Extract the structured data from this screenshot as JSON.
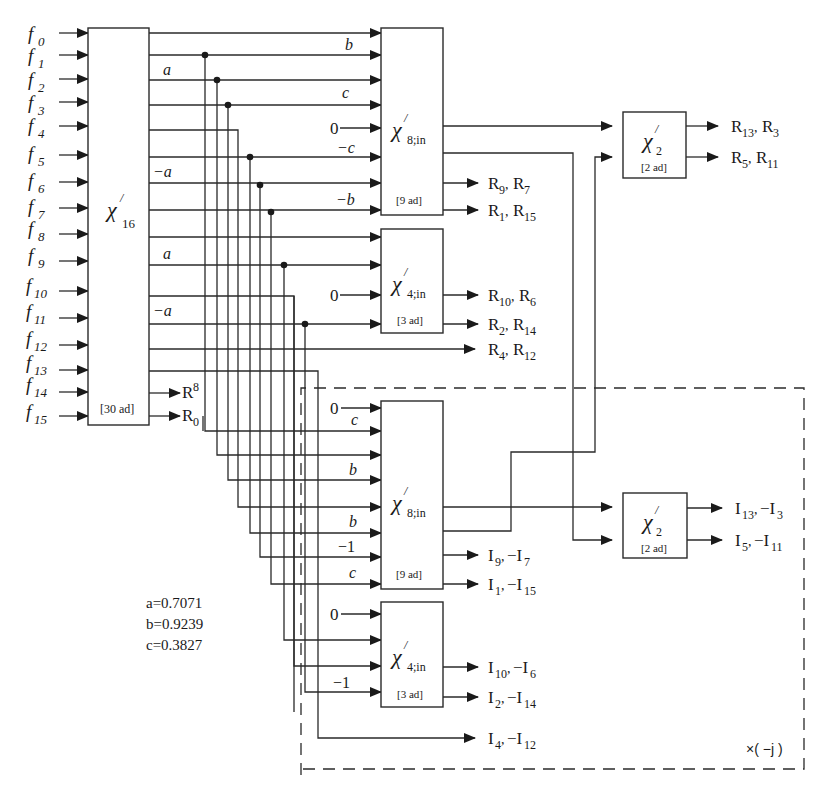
{
  "figure": {
    "type": "signal-flow block diagram",
    "inputs": [
      "f0",
      "f1",
      "f2",
      "f3",
      "f4",
      "f5",
      "f6",
      "f7",
      "f8",
      "f9",
      "f10",
      "f11",
      "f12",
      "f13",
      "f14",
      "f15"
    ],
    "blocks": {
      "chi16": {
        "label": "χ",
        "prime": "/",
        "sub": "16",
        "cost": "[30 ad]"
      },
      "chi8_real": {
        "label": "χ",
        "prime": "/",
        "sub": "8;in",
        "cost": "[9 ad]"
      },
      "chi4_real": {
        "label": "χ",
        "prime": "/",
        "sub": "4;in",
        "cost": "[3 ad]"
      },
      "chi2_real": {
        "label": "χ",
        "prime": "/",
        "sub": "2",
        "cost": "[2 ad]"
      },
      "chi8_imag": {
        "label": "χ",
        "prime": "/",
        "sub": "8;in",
        "cost": "[9 ad]"
      },
      "chi4_imag": {
        "label": "χ",
        "prime": "/",
        "sub": "4;in",
        "cost": "[3 ad]"
      },
      "chi2_imag": {
        "label": "χ",
        "prime": "/",
        "sub": "2",
        "cost": "[2 ad]"
      }
    },
    "chi16_direct_outputs": [
      "R8",
      "R0"
    ],
    "real_weights": {
      "chi8_in": [
        "",
        "b",
        "c",
        "0",
        "−c",
        "",
        "−b"
      ],
      "row_labels": [
        "a",
        "−a",
        "a",
        "−a"
      ],
      "chi4_in": [
        "0"
      ]
    },
    "imag_weights": {
      "chi8_in": [
        "0",
        "c",
        "",
        "b",
        "",
        "b",
        "−1",
        "c"
      ],
      "chi4_in": [
        "0",
        "",
        "",
        "−1"
      ]
    },
    "outputs": {
      "chi2_real": [
        [
          "R13",
          "R3"
        ],
        [
          "R5",
          "R11"
        ]
      ],
      "chi8_real": [
        [
          "R9",
          "R7"
        ],
        [
          "R1",
          "R15"
        ]
      ],
      "chi4_real": [
        [
          "R10",
          "R6"
        ],
        [
          "R2",
          "R14"
        ]
      ],
      "passthrough_real": [
        "R4",
        "R12"
      ],
      "chi2_imag": [
        [
          "I13",
          "−I3"
        ],
        [
          "I5",
          "−I11"
        ]
      ],
      "chi8_imag": [
        [
          "I9",
          "−I7"
        ],
        [
          "I1",
          "−I15"
        ]
      ],
      "chi4_imag": [
        [
          "I10",
          "−I6"
        ],
        [
          "I2",
          "−I14"
        ]
      ],
      "passthrough_imag": [
        "I4",
        "−I12"
      ]
    },
    "constants": [
      {
        "name": "a",
        "text": "a=0.7071"
      },
      {
        "name": "b",
        "text": "b=0.9239"
      },
      {
        "name": "c",
        "text": "c=0.3827"
      }
    ],
    "dashed_region_label": "×( −j )"
  },
  "labels": {
    "f": "f",
    "sub": [
      "0",
      "1",
      "2",
      "3",
      "4",
      "5",
      "6",
      "7",
      "8",
      "9",
      "10",
      "11",
      "12",
      "13",
      "14",
      "15"
    ],
    "weight_a": "a",
    "weight_neg_a": "−a",
    "weight_b": "b",
    "weight_neg_b": "−b",
    "weight_c": "c",
    "weight_neg_c": "−c",
    "weight_neg_one": "−1",
    "zero": "0",
    "chi": "χ",
    "prime": "/",
    "sub16": "16",
    "sub8in": "8;in",
    "sub4in": "4;in",
    "sub2": "2",
    "cost30": "[30 ad]",
    "cost9": "[9 ad]",
    "cost3": "[3 ad]",
    "cost2": "[2 ad]",
    "R": "R",
    "I": "I",
    "negI": "−I",
    "comma": ",",
    "n0": "0",
    "n1": "1",
    "n2": "2",
    "n3": "3",
    "n4": "4",
    "n5": "5",
    "n6": "6",
    "n7": "7",
    "n8": "8",
    "n9": "9",
    "n10": "10",
    "n11": "11",
    "n12": "12",
    "n13": "13",
    "n14": "14",
    "n15": "15",
    "const_a": "a=0.7071",
    "const_b": "b=0.9239",
    "const_c": "c=0.3827",
    "times_neg_j": "×( −j )"
  }
}
